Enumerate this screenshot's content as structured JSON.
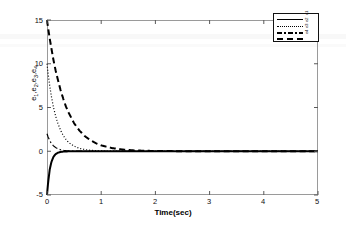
{
  "figure": {
    "background": "#ffffff",
    "frame_color": "#9a9a9a"
  },
  "axis": {
    "xlabel": "Time(sec)",
    "ylabel_parts": [
      "e",
      "1",
      ",e",
      "2",
      ",e",
      "3",
      ",e",
      "4"
    ],
    "ylabel_plain": "e1,e2,e3,e4",
    "xticks": [
      "0",
      "1",
      "2",
      "3",
      "4",
      "5"
    ],
    "yticks": [
      "15",
      "10",
      "5",
      "0",
      "-5"
    ]
  },
  "legend": {
    "position": "upper-right",
    "boxed": true,
    "entries": [
      {
        "label": "e1",
        "style": "solid"
      },
      {
        "label": "e2",
        "style": "dotted"
      },
      {
        "label": "e3",
        "style": "dashdot"
      },
      {
        "label": "e4",
        "style": "dashed"
      }
    ]
  },
  "chart_data": {
    "type": "line",
    "title": "",
    "xlabel": "Time(sec)",
    "ylabel": "e1,e2,e3,e4",
    "xlim": [
      0,
      5
    ],
    "ylim": [
      -5,
      15
    ],
    "xticks": [
      0,
      1,
      2,
      3,
      4,
      5
    ],
    "yticks": [
      -5,
      0,
      5,
      10,
      15
    ],
    "grid": false,
    "legend_position": "upper right",
    "x": [
      0,
      0.02,
      0.05,
      0.08,
      0.12,
      0.16,
      0.2,
      0.25,
      0.3,
      0.35,
      0.4,
      0.5,
      0.6,
      0.7,
      0.8,
      0.9,
      1.0,
      1.2,
      1.4,
      1.6,
      1.8,
      2.0,
      2.5,
      3.0,
      3.5,
      4.0,
      4.5,
      5.0
    ],
    "series": [
      {
        "name": "e1",
        "style": "solid",
        "color": "#000000",
        "width": 2.0,
        "values": [
          -5.0,
          -3.6,
          -2.1,
          -1.25,
          -0.62,
          -0.32,
          -0.17,
          -0.08,
          -0.04,
          -0.02,
          -0.01,
          0.0,
          0.0,
          0.0,
          0.0,
          0.0,
          0.0,
          0.0,
          0.0,
          0.0,
          0.0,
          0.0,
          0.0,
          0.0,
          0.0,
          0.0,
          0.0,
          0.0
        ]
      },
      {
        "name": "e2",
        "style": "dotted",
        "color": "#000000",
        "width": 1.2,
        "values": [
          10.0,
          8.9,
          7.5,
          6.3,
          5.0,
          4.0,
          3.2,
          2.4,
          1.8,
          1.35,
          1.0,
          0.58,
          0.33,
          0.19,
          0.11,
          0.065,
          0.037,
          0.013,
          0.005,
          0.002,
          0.001,
          0.0,
          0.0,
          0.0,
          0.0,
          0.0,
          0.0,
          0.0
        ]
      },
      {
        "name": "e3",
        "style": "dashdot",
        "color": "#000000",
        "width": 1.2,
        "values": [
          2.0,
          1.64,
          1.22,
          0.91,
          0.62,
          0.42,
          0.29,
          0.17,
          0.1,
          0.06,
          0.036,
          0.013,
          0.005,
          0.002,
          0.001,
          0.0,
          0.0,
          0.0,
          0.0,
          0.0,
          0.0,
          0.0,
          0.0,
          0.0,
          0.0,
          0.0,
          0.0,
          0.0
        ]
      },
      {
        "name": "e4",
        "style": "dashed",
        "color": "#000000",
        "width": 2.0,
        "values": [
          15.0,
          14.1,
          12.9,
          11.8,
          10.4,
          9.2,
          8.2,
          7.0,
          6.0,
          5.1,
          4.4,
          3.2,
          2.35,
          1.72,
          1.26,
          0.92,
          0.67,
          0.36,
          0.19,
          0.1,
          0.055,
          0.03,
          0.006,
          0.001,
          0.0,
          0.0,
          0.0,
          0.0
        ]
      }
    ]
  }
}
